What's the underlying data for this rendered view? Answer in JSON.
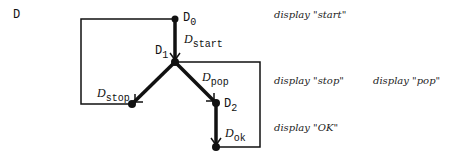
{
  "diagram": {
    "title": "D",
    "nodes": [
      {
        "id": "D0",
        "base": "D",
        "sub": "0",
        "x": 175,
        "y": 19
      },
      {
        "id": "D1",
        "base": "D",
        "sub": "1",
        "x": 175,
        "y": 62
      },
      {
        "id": "Dstop_node",
        "x": 132,
        "y": 105
      },
      {
        "id": "D2",
        "base": "D",
        "sub": "2",
        "x": 216,
        "y": 103
      },
      {
        "id": "Dok_node",
        "x": 216,
        "y": 147
      }
    ],
    "edges": [
      {
        "from": "D0",
        "to": "D1",
        "label_base": "D",
        "label_sub": "start"
      },
      {
        "from": "D1",
        "to": "Dstop_node",
        "label_base": "D",
        "label_sub": "stop"
      },
      {
        "from": "D1",
        "to": "D2",
        "label_base": "D",
        "label_sub": "pop"
      },
      {
        "from": "D2",
        "to": "Dok_node",
        "label_base": "D",
        "label_sub": "ok"
      }
    ],
    "labels": {
      "d0_base": "D",
      "d0_sub": "0",
      "d1_base": "D",
      "d1_sub": "1",
      "d2_base": "D",
      "d2_sub": "2",
      "start_base": "D",
      "start_sub": "start",
      "stop_base": "D",
      "stop_sub": "stop",
      "pop_base": "D",
      "pop_sub": "pop",
      "ok_base": "D",
      "ok_sub": "ok"
    },
    "actions": {
      "start": "display \"start\"",
      "stop": "display \"stop\"",
      "pop": "display \"pop\"",
      "ok": "display \"OK\""
    },
    "colors": {
      "ink": "#111111",
      "background": "#ffffff"
    }
  }
}
